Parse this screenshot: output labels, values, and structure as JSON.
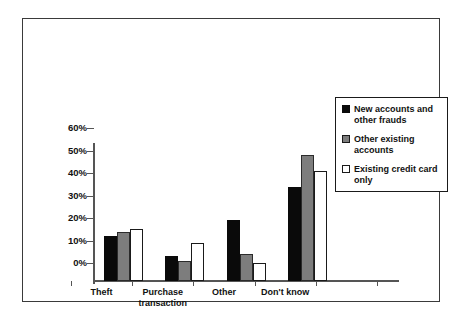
{
  "chart_data": {
    "type": "bar",
    "title": "",
    "subtitle": "",
    "xlabel": "",
    "ylabel": "",
    "categories": [
      "Theft",
      "Purchase\ntransaction",
      "Other",
      "Don't know"
    ],
    "series": [
      {
        "name": "New accounts and other frauds",
        "color": "#0a0a0a",
        "values": [
          20,
          11,
          27,
          42
        ]
      },
      {
        "name": "Other existing accounts",
        "color": "#7d7d7d",
        "values": [
          22,
          9,
          12,
          56
        ]
      },
      {
        "name": "Existing credit card only",
        "color": "#ffffff",
        "values": [
          23,
          17,
          8,
          49
        ]
      }
    ],
    "ylim": [
      0,
      60
    ],
    "yticks": [
      0,
      10,
      20,
      30,
      40,
      50,
      60
    ],
    "ytick_labels": [
      "0%",
      "10%",
      "20%",
      "30%",
      "40%",
      "50%",
      "60%"
    ],
    "grid": false,
    "legend_position": "top-right"
  },
  "legend": {
    "items": [
      {
        "label": "New accounts and other frauds",
        "swatch": "black-square-swatch"
      },
      {
        "label": "Other existing accounts",
        "swatch": "gray-square-swatch"
      },
      {
        "label": "Existing credit card only",
        "swatch": "white-square-swatch"
      }
    ]
  }
}
